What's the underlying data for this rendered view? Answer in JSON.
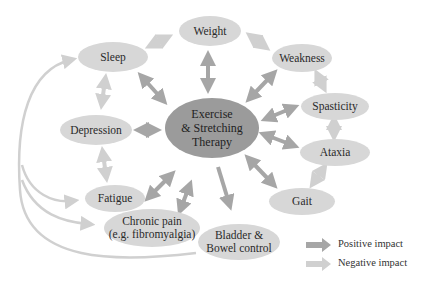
{
  "center": {
    "label": "Exercise\n& Stretching\nTherapy",
    "line1": "Exercise",
    "line2": "& Stretching",
    "line3": "Therapy"
  },
  "nodes": {
    "weight": "Weight",
    "sleep": "Sleep",
    "weakness": "Weakness",
    "spasticity": "Spasticity",
    "ataxia": "Ataxia",
    "gait": "Gait",
    "depression": "Depression",
    "fatigue": "Fatigue",
    "chronic_pain_1": "Chronic pain",
    "chronic_pain_2": "(e.g. fibromyalgia)",
    "bladder_1": "Bladder &",
    "bladder_2": "Bowel control"
  },
  "legend": {
    "positive": "Positive impact",
    "negative": "Negative impact"
  },
  "colors": {
    "center": "#9b9b9b",
    "node": "#d7d7d7",
    "positive_arrow": "#a6a6a6",
    "negative_arrow": "#d0d0d0"
  }
}
